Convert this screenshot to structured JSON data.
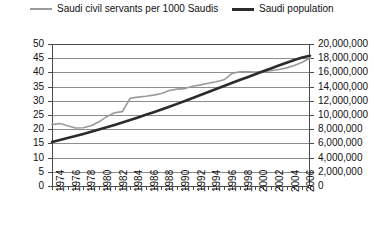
{
  "chart_data": {
    "type": "line",
    "title": "",
    "xlabel": "",
    "ylabel": "",
    "legend_position": "top",
    "grid": true,
    "x": [
      1974,
      1975,
      1976,
      1977,
      1978,
      1979,
      1980,
      1981,
      1982,
      1983,
      1984,
      1985,
      1986,
      1987,
      1988,
      1989,
      1990,
      1991,
      1992,
      1993,
      1994,
      1995,
      1996,
      1997,
      1998,
      1999,
      2000,
      2001,
      2002,
      2003,
      2004,
      2005,
      2006,
      2007
    ],
    "x_tick_labels": [
      "1974",
      "1976",
      "1978",
      "1980",
      "1982",
      "1984",
      "1986",
      "1988",
      "1990",
      "1992",
      "1994",
      "1996",
      "1998",
      "2000",
      "2002",
      "2004",
      "2006"
    ],
    "axes": {
      "left": {
        "label": "",
        "ticks": [
          "0",
          "5",
          "10",
          "15",
          "20",
          "25",
          "30",
          "35",
          "40",
          "45",
          "50"
        ],
        "min": 0,
        "max": 50,
        "step": 5
      },
      "right": {
        "label": "",
        "ticks": [
          "0",
          "2,000,000",
          "4,000,000",
          "6,000,000",
          "8,000,000",
          "10,000,000",
          "12,000,000",
          "14,000,000",
          "16,000,000",
          "18,000,000",
          "20,000,000"
        ],
        "min": 0,
        "max": 20000000,
        "step": 2000000
      }
    },
    "series": [
      {
        "name": "Saudi civil servants per 1000 Saudis",
        "axis": "left",
        "color": "#9a9a9a",
        "width": 1.6,
        "values": [
          21.6,
          22.0,
          21.2,
          20.4,
          20.5,
          21.2,
          22.6,
          24.4,
          25.8,
          26.2,
          30.9,
          31.3,
          31.6,
          32.0,
          32.6,
          33.6,
          34.1,
          34.3,
          35.1,
          35.6,
          36.2,
          36.7,
          37.4,
          39.6,
          40.2,
          40.2,
          40.1,
          40.3,
          40.6,
          41.0,
          41.6,
          42.4,
          43.6,
          45.0
        ]
      },
      {
        "name": "Saudi population",
        "axis": "right",
        "color": "#2b2b2b",
        "width": 2.6,
        "values": [
          6200000,
          6480000,
          6760000,
          7050000,
          7340000,
          7640000,
          7950000,
          8270000,
          8600000,
          8950000,
          9300000,
          9660000,
          10030000,
          10400000,
          10780000,
          11170000,
          11570000,
          11980000,
          12400000,
          12820000,
          13240000,
          13660000,
          14080000,
          14500000,
          14920000,
          15330000,
          15740000,
          16150000,
          16560000,
          16970000,
          17370000,
          17760000,
          18100000,
          18350000
        ]
      }
    ]
  },
  "legend": {
    "items": [
      {
        "label": "Saudi civil servants per 1000 Saudis"
      },
      {
        "label": "Saudi population"
      }
    ]
  }
}
